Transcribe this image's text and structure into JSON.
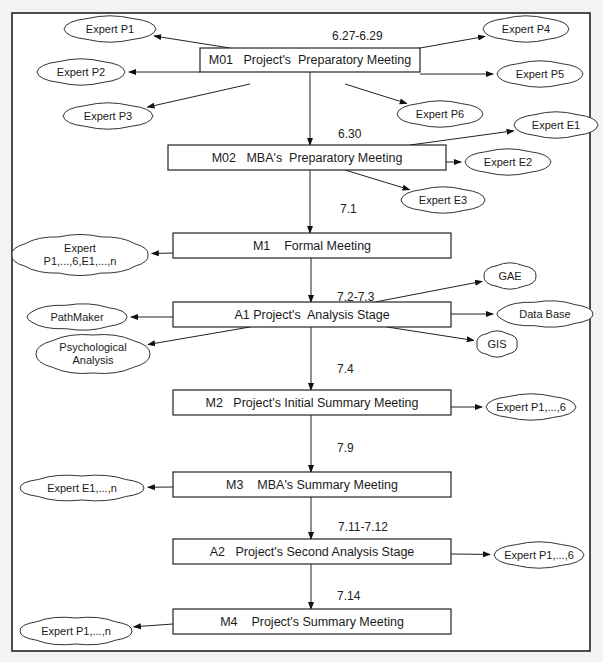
{
  "diagram": {
    "nodes": [
      {
        "id": "M01",
        "label": "M01   Project's  Preparatory Meeting",
        "x": 200,
        "y": 48,
        "w": 220,
        "h": 24
      },
      {
        "id": "M02",
        "label": "M02   MBA's  Preparatory Meeting",
        "x": 168,
        "y": 145,
        "w": 278,
        "h": 25
      },
      {
        "id": "M1",
        "label": "M1    Formal Meeting",
        "x": 173,
        "y": 233,
        "w": 278,
        "h": 25
      },
      {
        "id": "A1",
        "label": "A1 Project's  Analysis Stage",
        "x": 173,
        "y": 302,
        "w": 278,
        "h": 25
      },
      {
        "id": "M2",
        "label": "M2   Project's Initial Summary Meeting",
        "x": 173,
        "y": 390,
        "w": 278,
        "h": 25
      },
      {
        "id": "M3",
        "label": "M3    MBA's Summary Meeting",
        "x": 173,
        "y": 472,
        "w": 278,
        "h": 25
      },
      {
        "id": "A2",
        "label": "A2   Project's Second Analysis Stage",
        "x": 173,
        "y": 539,
        "w": 278,
        "h": 25
      },
      {
        "id": "M4",
        "label": "M4    Project's Summary Meeting",
        "x": 173,
        "y": 609,
        "w": 278,
        "h": 25
      }
    ],
    "clouds": [
      {
        "id": "c-p1",
        "lines": [
          "Expert P1"
        ],
        "cx": 110,
        "cy": 29,
        "rx": 46,
        "ry": 12,
        "from": "M01",
        "fx": 230,
        "fy": 48
      },
      {
        "id": "c-p2",
        "lines": [
          "Expert P2"
        ],
        "cx": 81,
        "cy": 72,
        "rx": 44,
        "ry": 12,
        "from": "M01",
        "fx": 200,
        "fy": 72
      },
      {
        "id": "c-p3",
        "lines": [
          "Expert P3"
        ],
        "cx": 108,
        "cy": 116,
        "rx": 45,
        "ry": 12,
        "from": "M01",
        "fx": 250,
        "fy": 84
      },
      {
        "id": "c-p4",
        "lines": [
          "Expert P4"
        ],
        "cx": 526,
        "cy": 29,
        "rx": 43,
        "ry": 12,
        "from": "M01",
        "fx": 370,
        "fy": 57
      },
      {
        "id": "c-p5",
        "lines": [
          "Expert P5"
        ],
        "cx": 540,
        "cy": 74,
        "rx": 43,
        "ry": 12,
        "from": "M01",
        "fx": 420,
        "fy": 74
      },
      {
        "id": "c-p6",
        "lines": [
          "Expert P6"
        ],
        "cx": 440,
        "cy": 114,
        "rx": 43,
        "ry": 12,
        "from": "M01",
        "fx": 345,
        "fy": 84
      },
      {
        "id": "c-e1",
        "lines": [
          "Expert E1"
        ],
        "cx": 556,
        "cy": 125,
        "rx": 42,
        "ry": 12,
        "from": "M02",
        "fx": 410,
        "fy": 145
      },
      {
        "id": "c-e2",
        "lines": [
          "Expert E2"
        ],
        "cx": 508,
        "cy": 162,
        "rx": 43,
        "ry": 12,
        "from": "M02",
        "fx": 446,
        "fy": 162
      },
      {
        "id": "c-e3",
        "lines": [
          "Expert E3"
        ],
        "cx": 443,
        "cy": 200,
        "rx": 42,
        "ry": 12,
        "from": "M02",
        "fx": 345,
        "fy": 170
      },
      {
        "id": "c-m1",
        "lines": [
          "Expert",
          "P1,...,6,E1,...,n"
        ],
        "cx": 80,
        "cy": 255,
        "rx": 68,
        "ry": 19,
        "from": "M1",
        "fx": 173,
        "fy": 253
      },
      {
        "id": "c-gae",
        "lines": [
          "GAE"
        ],
        "cx": 510,
        "cy": 276,
        "rx": 26,
        "ry": 12,
        "from": "A1",
        "fx": 375,
        "fy": 302
      },
      {
        "id": "c-db",
        "lines": [
          "Data Base"
        ],
        "cx": 545,
        "cy": 314,
        "rx": 48,
        "ry": 12,
        "from": "A1",
        "fx": 451,
        "fy": 314
      },
      {
        "id": "c-gis",
        "lines": [
          "GIS"
        ],
        "cx": 497,
        "cy": 344,
        "rx": 20,
        "ry": 12,
        "from": "A1",
        "fx": 387,
        "fy": 327
      },
      {
        "id": "c-pm",
        "lines": [
          "PathMaker"
        ],
        "cx": 77,
        "cy": 317,
        "rx": 50,
        "ry": 12,
        "from": "A1",
        "fx": 173,
        "fy": 317
      },
      {
        "id": "c-psy",
        "lines": [
          "Psychological",
          "Analysis"
        ],
        "cx": 93,
        "cy": 354,
        "rx": 57,
        "ry": 19,
        "from": "A1",
        "fx": 250,
        "fy": 327
      },
      {
        "id": "c-m2",
        "lines": [
          "Expert P1,...,6"
        ],
        "cx": 531,
        "cy": 407,
        "rx": 45,
        "ry": 12,
        "from": "M2",
        "fx": 451,
        "fy": 407
      },
      {
        "id": "c-m3",
        "lines": [
          "Expert E1,...,n"
        ],
        "cx": 82,
        "cy": 488,
        "rx": 62,
        "ry": 12,
        "from": "M3",
        "fx": 173,
        "fy": 487
      },
      {
        "id": "c-a2",
        "lines": [
          "Expert P1,...,6"
        ],
        "cx": 539,
        "cy": 555,
        "rx": 45,
        "ry": 12,
        "from": "A2",
        "fx": 451,
        "fy": 554
      },
      {
        "id": "c-m4",
        "lines": [
          "Expert P1,...,n"
        ],
        "cx": 76,
        "cy": 631,
        "rx": 56,
        "ry": 13,
        "from": "M4",
        "fx": 173,
        "fy": 624
      }
    ],
    "dates": [
      {
        "label": "6.27-6.29",
        "x": 332,
        "y": 40
      },
      {
        "label": "6.30",
        "x": 338,
        "y": 138
      },
      {
        "label": "7.1",
        "x": 340,
        "y": 213
      },
      {
        "label": "7.2-7.3",
        "x": 337,
        "y": 301
      },
      {
        "label": "7.4",
        "x": 337,
        "y": 373
      },
      {
        "label": "7.9",
        "x": 337,
        "y": 452
      },
      {
        "label": "7.11-7.12",
        "x": 338,
        "y": 531
      },
      {
        "label": "7.14",
        "x": 337,
        "y": 600
      }
    ],
    "flow": [
      {
        "x": 310,
        "y1": 72,
        "y2": 145
      },
      {
        "x": 310,
        "y1": 170,
        "y2": 233
      },
      {
        "x": 311,
        "y1": 258,
        "y2": 302
      },
      {
        "x": 311,
        "y1": 327,
        "y2": 390
      },
      {
        "x": 311,
        "y1": 415,
        "y2": 472
      },
      {
        "x": 311,
        "y1": 497,
        "y2": 539
      },
      {
        "x": 311,
        "y1": 564,
        "y2": 609
      }
    ]
  }
}
